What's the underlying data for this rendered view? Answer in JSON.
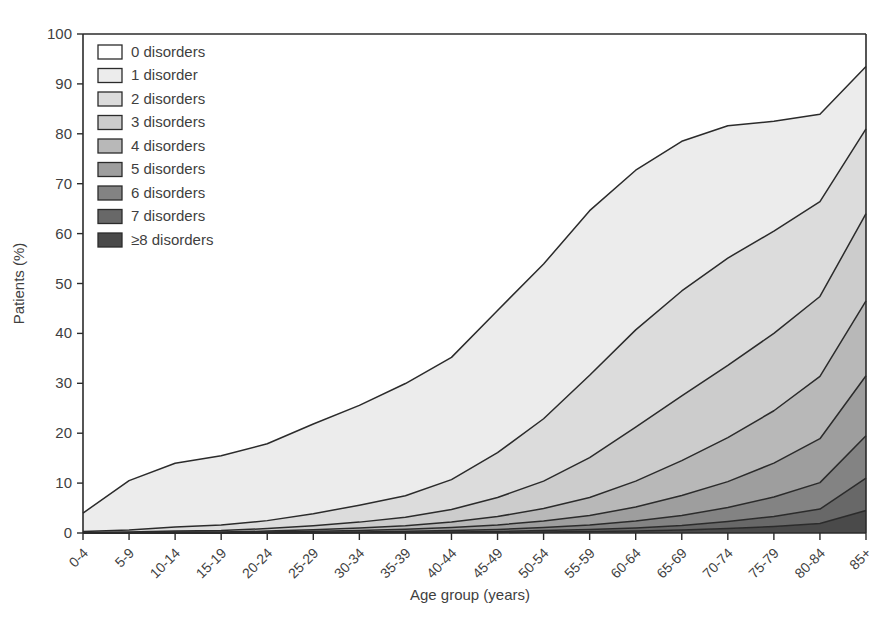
{
  "figure": {
    "title_fragment": "",
    "title_visible": false
  },
  "chart_data": {
    "type": "area",
    "stacked": true,
    "title": "",
    "xlabel": "Age group (years)",
    "ylabel": "Patients (%)",
    "ylim": [
      0,
      100
    ],
    "yticks": [
      0,
      10,
      20,
      30,
      40,
      50,
      60,
      70,
      80,
      90,
      100
    ],
    "grid": false,
    "legend_position": "top-left",
    "categories": [
      "0-4",
      "5-9",
      "10-14",
      "15-19",
      "20-24",
      "25-29",
      "30-34",
      "35-39",
      "40-44",
      "45-49",
      "50-54",
      "55-59",
      "60-64",
      "65-69",
      "70-74",
      "75-79",
      "80-84",
      "85+"
    ],
    "series": [
      {
        "name": "0 disorders",
        "color": "#ffffff",
        "values": [
          96.0,
          89.5,
          86.0,
          84.5,
          82.0,
          78.0,
          74.0,
          70.0,
          65.0,
          56.0,
          47.0,
          36.0,
          27.0,
          21.0,
          15.0,
          10.0,
          7.5,
          6.0
        ]
      },
      {
        "name": "1 disorder",
        "color": "#ececec",
        "values": [
          3.7,
          9.9,
          12.8,
          13.9,
          15.4,
          18.0,
          20.0,
          22.5,
          24.5,
          28.5,
          31.0,
          33.0,
          32.0,
          30.0,
          26.5,
          22.0,
          17.5,
          12.5
        ]
      },
      {
        "name": "2 disorders",
        "color": "#dcdcdc",
        "values": [
          0.2,
          0.4,
          0.8,
          1.1,
          1.6,
          2.4,
          3.4,
          4.3,
          6.0,
          9.0,
          12.5,
          16.5,
          19.5,
          21.0,
          21.5,
          20.5,
          19.0,
          17.0
        ]
      },
      {
        "name": "3 disorders",
        "color": "#cccccc",
        "values": [
          0.05,
          0.1,
          0.2,
          0.3,
          0.5,
          0.8,
          1.2,
          1.7,
          2.5,
          3.8,
          5.5,
          8.0,
          10.8,
          13.0,
          14.5,
          15.5,
          16.0,
          17.5
        ]
      },
      {
        "name": "4 disorders",
        "color": "#b8b8b8",
        "values": [
          0.02,
          0.05,
          0.1,
          0.1,
          0.2,
          0.3,
          0.5,
          0.7,
          1.1,
          1.7,
          2.5,
          3.6,
          5.2,
          7.0,
          8.8,
          10.5,
          12.5,
          15.0
        ]
      },
      {
        "name": "5 disorders",
        "color": "#9e9e9e",
        "values": [
          0.01,
          0.02,
          0.04,
          0.05,
          0.1,
          0.2,
          0.3,
          0.4,
          0.6,
          0.9,
          1.3,
          1.9,
          2.8,
          4.0,
          5.2,
          6.8,
          8.8,
          12.0
        ]
      },
      {
        "name": "6 disorders",
        "color": "#838383",
        "values": [
          0.01,
          0.01,
          0.02,
          0.02,
          0.05,
          0.1,
          0.1,
          0.2,
          0.3,
          0.4,
          0.6,
          0.9,
          1.4,
          2.0,
          2.8,
          3.9,
          5.3,
          8.5
        ]
      },
      {
        "name": "7 disorders",
        "color": "#686868",
        "values": [
          0.0,
          0.01,
          0.01,
          0.01,
          0.02,
          0.03,
          0.05,
          0.1,
          0.1,
          0.2,
          0.3,
          0.4,
          0.6,
          0.9,
          1.4,
          2.0,
          2.9,
          6.5
        ]
      },
      {
        "name": "≥8 disorders",
        "color": "#4a4a4a",
        "values": [
          0.0,
          0.01,
          0.01,
          0.01,
          0.01,
          0.02,
          0.03,
          0.05,
          0.1,
          0.1,
          0.2,
          0.3,
          0.4,
          0.6,
          0.9,
          1.3,
          1.9,
          4.5
        ]
      }
    ],
    "top_boundary_85plus": 94.0,
    "boundaries_85plus": [
      94.0,
      81.5,
      64.5,
      47.0,
      32.0,
      20.0,
      11.5,
      5.0,
      1.5
    ]
  },
  "legend": {
    "items": [
      "0 disorders",
      "1 disorder",
      "2 disorders",
      "3 disorders",
      "4 disorders",
      "5 disorders",
      "6 disorders",
      "7 disorders",
      "≥8 disorders"
    ]
  }
}
